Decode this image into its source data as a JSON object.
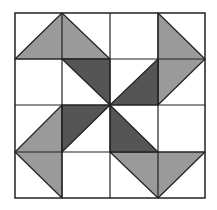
{
  "diagram": {
    "colors": {
      "background": "#ffffff",
      "light_patch": "#9a9a9a",
      "dark_patch": "#555555",
      "outline": "#222222"
    },
    "grid_divisions": 4,
    "pieces": [
      {
        "quadrant": "top-left",
        "shade": "light",
        "shape": "triangle"
      },
      {
        "quadrant": "top-left",
        "shade": "dark",
        "shape": "triangle"
      },
      {
        "quadrant": "top-right",
        "shade": "light",
        "shape": "triangle"
      },
      {
        "quadrant": "top-right",
        "shade": "dark",
        "shape": "triangle"
      },
      {
        "quadrant": "bottom-left",
        "shade": "light",
        "shape": "triangle"
      },
      {
        "quadrant": "bottom-left",
        "shade": "dark",
        "shape": "triangle"
      },
      {
        "quadrant": "bottom-right",
        "shade": "light",
        "shape": "triangle"
      },
      {
        "quadrant": "bottom-right",
        "shade": "dark",
        "shape": "triangle"
      }
    ]
  }
}
